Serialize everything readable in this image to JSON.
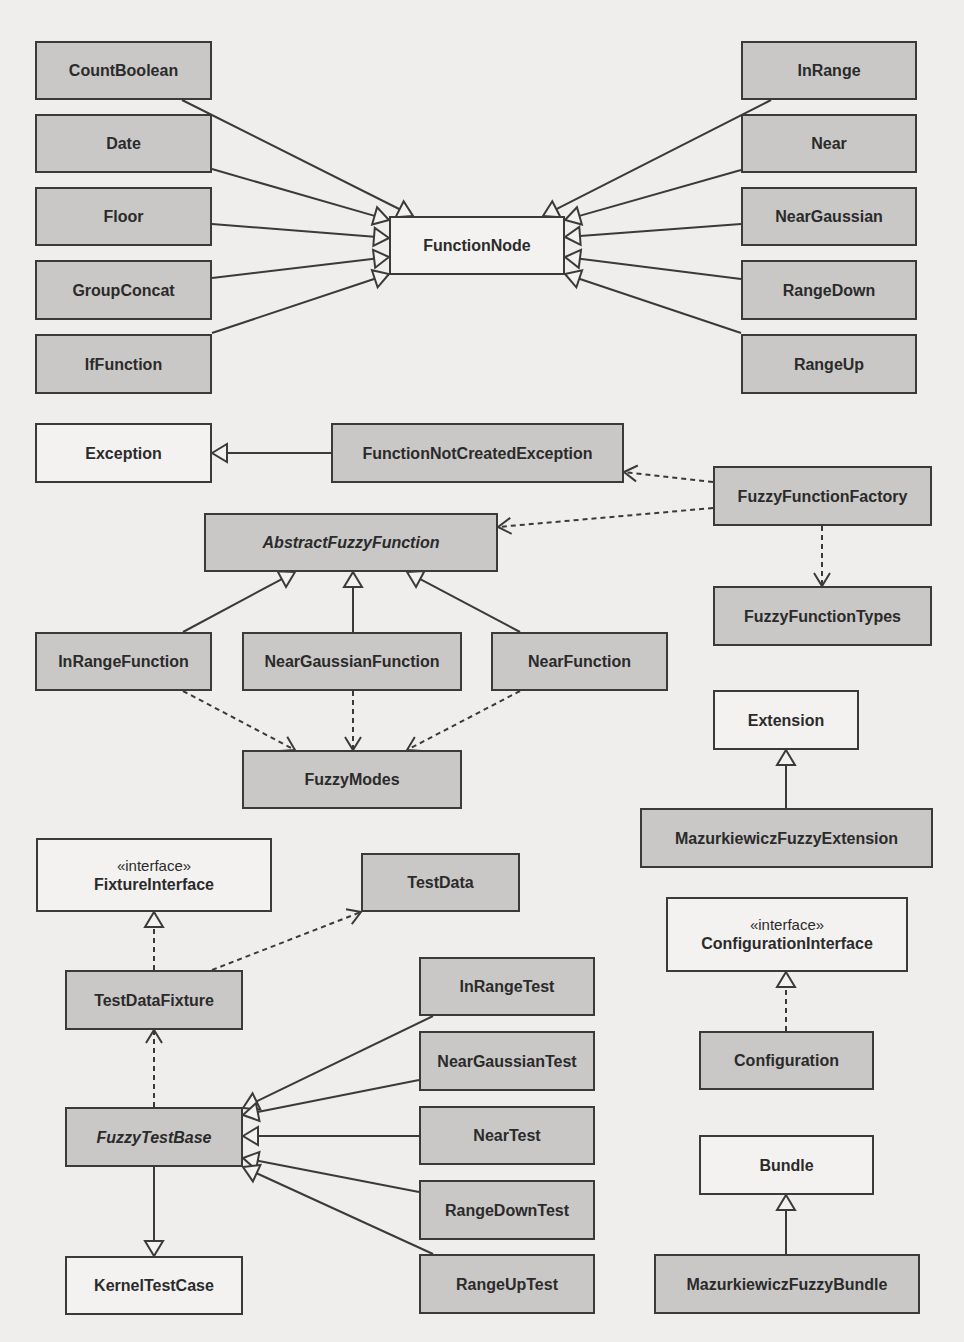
{
  "diagram": {
    "type": "uml-class-diagram",
    "colors": {
      "background": "#efeeec",
      "class_fill": "#c9c8c6",
      "external_fill": "#f3f2f0",
      "stroke": "#3a3a3a",
      "text": "#2b2b2b"
    },
    "classes": [
      {
        "id": "CountBoolean",
        "name": "CountBoolean",
        "x": 35,
        "y": 41,
        "w": 177,
        "h": 59,
        "fill": "filled"
      },
      {
        "id": "Date",
        "name": "Date",
        "x": 35,
        "y": 114,
        "w": 177,
        "h": 59,
        "fill": "filled"
      },
      {
        "id": "Floor",
        "name": "Floor",
        "x": 35,
        "y": 187,
        "w": 177,
        "h": 59,
        "fill": "filled"
      },
      {
        "id": "GroupConcat",
        "name": "GroupConcat",
        "x": 35,
        "y": 260,
        "w": 177,
        "h": 60,
        "fill": "filled"
      },
      {
        "id": "IfFunction",
        "name": "IfFunction",
        "x": 35,
        "y": 334,
        "w": 177,
        "h": 60,
        "fill": "filled"
      },
      {
        "id": "FunctionNode",
        "name": "FunctionNode",
        "x": 389,
        "y": 216,
        "w": 176,
        "h": 59,
        "fill": "plain"
      },
      {
        "id": "InRange",
        "name": "InRange",
        "x": 741,
        "y": 41,
        "w": 176,
        "h": 59,
        "fill": "filled"
      },
      {
        "id": "Near",
        "name": "Near",
        "x": 741,
        "y": 114,
        "w": 176,
        "h": 59,
        "fill": "filled"
      },
      {
        "id": "NearGaussian",
        "name": "NearGaussian",
        "x": 741,
        "y": 187,
        "w": 176,
        "h": 59,
        "fill": "filled"
      },
      {
        "id": "RangeDown",
        "name": "RangeDown",
        "x": 741,
        "y": 260,
        "w": 176,
        "h": 60,
        "fill": "filled"
      },
      {
        "id": "RangeUp",
        "name": "RangeUp",
        "x": 741,
        "y": 334,
        "w": 176,
        "h": 60,
        "fill": "filled"
      },
      {
        "id": "Exception",
        "name": "Exception",
        "x": 35,
        "y": 423,
        "w": 177,
        "h": 60,
        "fill": "plain"
      },
      {
        "id": "FunctionNotCreatedException",
        "name": "FunctionNotCreatedException",
        "x": 331,
        "y": 423,
        "w": 293,
        "h": 60,
        "fill": "filled"
      },
      {
        "id": "FuzzyFunctionFactory",
        "name": "FuzzyFunctionFactory",
        "x": 713,
        "y": 466,
        "w": 219,
        "h": 60,
        "fill": "filled"
      },
      {
        "id": "AbstractFuzzyFunction",
        "name": "AbstractFuzzyFunction",
        "x": 204,
        "y": 513,
        "w": 294,
        "h": 59,
        "fill": "filled",
        "abstract": true
      },
      {
        "id": "FuzzyFunctionTypes",
        "name": "FuzzyFunctionTypes",
        "x": 713,
        "y": 586,
        "w": 219,
        "h": 60,
        "fill": "filled"
      },
      {
        "id": "InRangeFunction",
        "name": "InRangeFunction",
        "x": 35,
        "y": 632,
        "w": 177,
        "h": 59,
        "fill": "filled"
      },
      {
        "id": "NearGaussianFunction",
        "name": "NearGaussianFunction",
        "x": 242,
        "y": 632,
        "w": 220,
        "h": 59,
        "fill": "filled"
      },
      {
        "id": "NearFunction",
        "name": "NearFunction",
        "x": 491,
        "y": 632,
        "w": 177,
        "h": 59,
        "fill": "filled"
      },
      {
        "id": "Extension",
        "name": "Extension",
        "x": 713,
        "y": 690,
        "w": 146,
        "h": 60,
        "fill": "plain"
      },
      {
        "id": "FuzzyModes",
        "name": "FuzzyModes",
        "x": 242,
        "y": 750,
        "w": 220,
        "h": 59,
        "fill": "filled"
      },
      {
        "id": "MazurkiewiczFuzzyExtension",
        "name": "MazurkiewiczFuzzyExtension",
        "x": 640,
        "y": 808,
        "w": 293,
        "h": 60,
        "fill": "filled"
      },
      {
        "id": "FixtureInterface",
        "name": "FixtureInterface",
        "stereotype": "«interface»",
        "x": 36,
        "y": 838,
        "w": 236,
        "h": 74,
        "fill": "plain"
      },
      {
        "id": "TestData",
        "name": "TestData",
        "x": 361,
        "y": 853,
        "w": 159,
        "h": 59,
        "fill": "filled"
      },
      {
        "id": "ConfigurationInterface",
        "name": "ConfigurationInterface",
        "stereotype": "«interface»",
        "x": 666,
        "y": 897,
        "w": 242,
        "h": 75,
        "fill": "plain"
      },
      {
        "id": "InRangeTest",
        "name": "InRangeTest",
        "x": 419,
        "y": 957,
        "w": 176,
        "h": 59,
        "fill": "filled"
      },
      {
        "id": "TestDataFixture",
        "name": "TestDataFixture",
        "x": 65,
        "y": 970,
        "w": 178,
        "h": 60,
        "fill": "filled"
      },
      {
        "id": "NearGaussianTest",
        "name": "NearGaussianTest",
        "x": 419,
        "y": 1031,
        "w": 176,
        "h": 60,
        "fill": "filled"
      },
      {
        "id": "Configuration",
        "name": "Configuration",
        "x": 699,
        "y": 1031,
        "w": 175,
        "h": 59,
        "fill": "filled"
      },
      {
        "id": "NearTest",
        "name": "NearTest",
        "x": 419,
        "y": 1106,
        "w": 176,
        "h": 59,
        "fill": "filled"
      },
      {
        "id": "FuzzyTestBase",
        "name": "FuzzyTestBase",
        "x": 65,
        "y": 1107,
        "w": 178,
        "h": 60,
        "fill": "filled",
        "abstract": true
      },
      {
        "id": "Bundle",
        "name": "Bundle",
        "x": 699,
        "y": 1135,
        "w": 175,
        "h": 60,
        "fill": "plain"
      },
      {
        "id": "RangeDownTest",
        "name": "RangeDownTest",
        "x": 419,
        "y": 1180,
        "w": 176,
        "h": 60,
        "fill": "filled"
      },
      {
        "id": "KernelTestCase",
        "name": "KernelTestCase",
        "x": 65,
        "y": 1256,
        "w": 178,
        "h": 59,
        "fill": "plain"
      },
      {
        "id": "RangeUpTest",
        "name": "RangeUpTest",
        "x": 419,
        "y": 1254,
        "w": 176,
        "h": 60,
        "fill": "filled"
      },
      {
        "id": "MazurkiewiczFuzzyBundle",
        "name": "MazurkiewiczFuzzyBundle",
        "x": 654,
        "y": 1254,
        "w": 266,
        "h": 60,
        "fill": "filled"
      }
    ],
    "relations": [
      {
        "from": "CountBoolean",
        "to": "FunctionNode",
        "kind": "generalization",
        "points": [
          [
            182,
            100
          ],
          [
            413,
            216
          ]
        ]
      },
      {
        "from": "Date",
        "to": "FunctionNode",
        "kind": "generalization",
        "points": [
          [
            212,
            169
          ],
          [
            389,
            220
          ]
        ]
      },
      {
        "from": "Floor",
        "to": "FunctionNode",
        "kind": "generalization",
        "points": [
          [
            212,
            224
          ],
          [
            389,
            238
          ]
        ]
      },
      {
        "from": "GroupConcat",
        "to": "FunctionNode",
        "kind": "generalization",
        "points": [
          [
            212,
            278
          ],
          [
            389,
            257
          ]
        ]
      },
      {
        "from": "IfFunction",
        "to": "FunctionNode",
        "kind": "generalization",
        "points": [
          [
            212,
            333
          ],
          [
            389,
            274
          ]
        ]
      },
      {
        "from": "InRange",
        "to": "FunctionNode",
        "kind": "generalization",
        "points": [
          [
            771,
            100
          ],
          [
            543,
            216
          ]
        ]
      },
      {
        "from": "Near",
        "to": "FunctionNode",
        "kind": "generalization",
        "points": [
          [
            741,
            170
          ],
          [
            565,
            220
          ]
        ]
      },
      {
        "from": "NearGaussian",
        "to": "FunctionNode",
        "kind": "generalization",
        "points": [
          [
            741,
            224
          ],
          [
            565,
            237
          ]
        ]
      },
      {
        "from": "RangeDown",
        "to": "FunctionNode",
        "kind": "generalization",
        "points": [
          [
            741,
            279
          ],
          [
            565,
            257
          ]
        ]
      },
      {
        "from": "RangeUp",
        "to": "FunctionNode",
        "kind": "generalization",
        "points": [
          [
            741,
            333
          ],
          [
            565,
            274
          ]
        ]
      },
      {
        "from": "FunctionNotCreatedException",
        "to": "Exception",
        "kind": "generalization",
        "points": [
          [
            331,
            453
          ],
          [
            212,
            453
          ]
        ]
      },
      {
        "from": "FuzzyFunctionFactory",
        "to": "FunctionNotCreatedException",
        "kind": "dependency",
        "points": [
          [
            713,
            482
          ],
          [
            624,
            472
          ]
        ]
      },
      {
        "from": "FuzzyFunctionFactory",
        "to": "AbstractFuzzyFunction",
        "kind": "dependency",
        "points": [
          [
            713,
            508
          ],
          [
            498,
            527
          ]
        ]
      },
      {
        "from": "FuzzyFunctionFactory",
        "to": "FuzzyFunctionTypes",
        "kind": "dependency",
        "points": [
          [
            822,
            526
          ],
          [
            822,
            586
          ]
        ]
      },
      {
        "from": "InRangeFunction",
        "to": "AbstractFuzzyFunction",
        "kind": "generalization",
        "points": [
          [
            183,
            632
          ],
          [
            295,
            572
          ]
        ]
      },
      {
        "from": "NearGaussianFunction",
        "to": "AbstractFuzzyFunction",
        "kind": "generalization",
        "points": [
          [
            353,
            632
          ],
          [
            353,
            572
          ]
        ]
      },
      {
        "from": "NearFunction",
        "to": "AbstractFuzzyFunction",
        "kind": "generalization",
        "points": [
          [
            520,
            632
          ],
          [
            407,
            572
          ]
        ]
      },
      {
        "from": "InRangeFunction",
        "to": "FuzzyModes",
        "kind": "dependency",
        "points": [
          [
            183,
            691
          ],
          [
            295,
            750
          ]
        ]
      },
      {
        "from": "NearGaussianFunction",
        "to": "FuzzyModes",
        "kind": "dependency",
        "points": [
          [
            353,
            691
          ],
          [
            353,
            750
          ]
        ]
      },
      {
        "from": "NearFunction",
        "to": "FuzzyModes",
        "kind": "dependency",
        "points": [
          [
            520,
            691
          ],
          [
            407,
            750
          ]
        ]
      },
      {
        "from": "MazurkiewiczFuzzyExtension",
        "to": "Extension",
        "kind": "generalization",
        "points": [
          [
            786,
            808
          ],
          [
            786,
            750
          ]
        ]
      },
      {
        "from": "TestDataFixture",
        "to": "FixtureInterface",
        "kind": "realization",
        "points": [
          [
            154,
            970
          ],
          [
            154,
            912
          ]
        ]
      },
      {
        "from": "TestDataFixture",
        "to": "TestData",
        "kind": "dependency",
        "points": [
          [
            212,
            970
          ],
          [
            361,
            912
          ]
        ]
      },
      {
        "from": "FuzzyTestBase",
        "to": "TestDataFixture",
        "kind": "dependency",
        "points": [
          [
            154,
            1107
          ],
          [
            154,
            1030
          ]
        ]
      },
      {
        "from": "FuzzyTestBase",
        "to": "KernelTestCase",
        "kind": "generalization",
        "points": [
          [
            154,
            1167
          ],
          [
            154,
            1256
          ]
        ]
      },
      {
        "from": "InRangeTest",
        "to": "FuzzyTestBase",
        "kind": "generalization",
        "points": [
          [
            433,
            1016
          ],
          [
            243,
            1108
          ]
        ]
      },
      {
        "from": "NearGaussianTest",
        "to": "FuzzyTestBase",
        "kind": "generalization",
        "points": [
          [
            419,
            1080
          ],
          [
            243,
            1115
          ]
        ]
      },
      {
        "from": "NearTest",
        "to": "FuzzyTestBase",
        "kind": "generalization",
        "points": [
          [
            419,
            1136
          ],
          [
            243,
            1136
          ]
        ]
      },
      {
        "from": "RangeDownTest",
        "to": "FuzzyTestBase",
        "kind": "generalization",
        "points": [
          [
            419,
            1192
          ],
          [
            243,
            1158
          ]
        ]
      },
      {
        "from": "RangeUpTest",
        "to": "FuzzyTestBase",
        "kind": "generalization",
        "points": [
          [
            433,
            1254
          ],
          [
            243,
            1167
          ]
        ]
      },
      {
        "from": "Configuration",
        "to": "ConfigurationInterface",
        "kind": "realization",
        "points": [
          [
            786,
            1031
          ],
          [
            786,
            972
          ]
        ]
      },
      {
        "from": "MazurkiewiczFuzzyBundle",
        "to": "Bundle",
        "kind": "generalization",
        "points": [
          [
            786,
            1254
          ],
          [
            786,
            1195
          ]
        ]
      }
    ]
  }
}
